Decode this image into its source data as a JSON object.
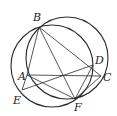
{
  "figure": {
    "type": "geometry",
    "stroke_color": "#2a2a2a",
    "points": {
      "B": {
        "label": "B",
        "x": 39,
        "y": 27,
        "lx": 33,
        "ly": 12
      },
      "A": {
        "label": "A",
        "x": 27,
        "y": 75,
        "lx": 18,
        "ly": 71
      },
      "D": {
        "label": "D",
        "x": 93,
        "y": 65,
        "lx": 95,
        "ly": 55
      },
      "C": {
        "label": "C",
        "x": 101,
        "y": 76,
        "lx": 103,
        "ly": 72
      },
      "E": {
        "label": "E",
        "x": 22,
        "y": 90,
        "lx": 13,
        "ly": 95
      },
      "F": {
        "label": "F",
        "x": 75,
        "y": 99,
        "lx": 74,
        "ly": 102
      }
    },
    "circles": [
      {
        "name": "circle-BDF",
        "cx": 52,
        "cy": 66,
        "r": 41
      },
      {
        "name": "circle-BCFA",
        "cx": 67,
        "cy": 58,
        "r": 41
      }
    ],
    "segments": [
      [
        "B",
        "A"
      ],
      [
        "B",
        "F"
      ],
      [
        "B",
        "C"
      ],
      [
        "A",
        "C"
      ],
      [
        "A",
        "F"
      ],
      [
        "A",
        "E"
      ],
      [
        "E",
        "D"
      ],
      [
        "D",
        "F"
      ],
      [
        "C",
        "F"
      ]
    ]
  }
}
